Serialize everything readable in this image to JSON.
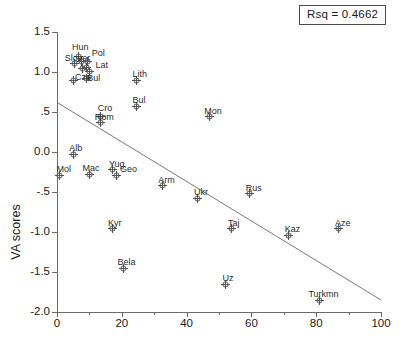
{
  "annotation": {
    "rsq_label": "Rsq = 0.4662"
  },
  "axes": {
    "ylabel": "VA scores",
    "xlabel": "",
    "y_ticks": [
      "1.5",
      "1.0",
      ".5",
      "0.0",
      "-.5",
      "-1.0",
      "-1.5",
      "-2.0"
    ],
    "x_ticks": [
      "0",
      "20",
      "40",
      "60",
      "80",
      "100"
    ]
  },
  "chart_data": {
    "type": "scatter",
    "title": "",
    "xlabel": "",
    "ylabel": "VA scores",
    "xlim": [
      0,
      100
    ],
    "ylim": [
      -2.0,
      1.5
    ],
    "grid": false,
    "legend": null,
    "annotations": [
      {
        "name": "rsq",
        "text": "Rsq = 0.4662",
        "value": 0.4662
      }
    ],
    "trendline": {
      "type": "linear",
      "x": [
        0,
        100
      ],
      "y": [
        0.62,
        -1.85
      ],
      "slope": -0.0247,
      "intercept": 0.62
    },
    "points": [
      {
        "label": "Hun",
        "x": 6.5,
        "y": 1.19
      },
      {
        "label": "Slov",
        "x": 5.5,
        "y": 1.11
      },
      {
        "label": "Slover",
        "x": 7.5,
        "y": 1.13
      },
      {
        "label": "Pol",
        "x": 9.5,
        "y": 1.13
      },
      {
        "label": "Cze",
        "x": 8.0,
        "y": 1.05
      },
      {
        "label": "Est",
        "x": 9.0,
        "y": 1.06
      },
      {
        "label": "Lat",
        "x": 10.0,
        "y": 1.01
      },
      {
        "label": "Cro",
        "x": 5.0,
        "y": 0.9
      },
      {
        "label": "Bul2",
        "x": 9.0,
        "y": 0.92
      },
      {
        "label": "Lith",
        "x": 24.5,
        "y": 0.9
      },
      {
        "label": "Bul",
        "x": 24.5,
        "y": 0.57
      },
      {
        "label": "Cro2",
        "x": 13.5,
        "y": 0.44
      },
      {
        "label": "Rom",
        "x": 13.5,
        "y": 0.37
      },
      {
        "label": "Mon",
        "x": 47.0,
        "y": 0.44
      },
      {
        "label": "Alb",
        "x": 5.0,
        "y": -0.03
      },
      {
        "label": "Mol",
        "x": 0.8,
        "y": -0.29
      },
      {
        "label": "Mac",
        "x": 10.0,
        "y": -0.28
      },
      {
        "label": "Yug",
        "x": 17.0,
        "y": -0.22
      },
      {
        "label": "Geo",
        "x": 18.5,
        "y": -0.29
      },
      {
        "label": "Arm",
        "x": 32.5,
        "y": -0.42
      },
      {
        "label": "Ukr",
        "x": 43.5,
        "y": -0.58
      },
      {
        "label": "Rus",
        "x": 59.5,
        "y": -0.52
      },
      {
        "label": "Kyr",
        "x": 17.0,
        "y": -0.96
      },
      {
        "label": "Taj",
        "x": 54.0,
        "y": -0.96
      },
      {
        "label": "Kaz",
        "x": 71.5,
        "y": -1.04
      },
      {
        "label": "Aze",
        "x": 87.0,
        "y": -0.96
      },
      {
        "label": "Bela",
        "x": 20.5,
        "y": -1.45
      },
      {
        "label": "Uz",
        "x": 52.0,
        "y": -1.65
      },
      {
        "label": "Turkmn",
        "x": 81.0,
        "y": -1.85
      }
    ],
    "point_labels": [
      {
        "text": "Hun",
        "x": 6.5,
        "y": 1.19,
        "dx": -6,
        "dy": -14
      },
      {
        "text": "Slover",
        "x": 5.5,
        "y": 1.13,
        "dx": -10,
        "dy": -8
      },
      {
        "text": "Pol",
        "x": 9.5,
        "y": 1.17,
        "dx": 4,
        "dy": -9
      },
      {
        "text": "Lat",
        "x": 10.0,
        "y": 1.07,
        "dx": 6,
        "dy": -5
      },
      {
        "text": "Cze",
        "x": 8.0,
        "y": 1.0,
        "dx": -8,
        "dy": 1
      },
      {
        "text": "Bul",
        "x": 9.0,
        "y": 0.99,
        "dx": 1,
        "dy": 1
      },
      {
        "text": "Lith",
        "x": 24.5,
        "y": 0.9,
        "dx": -4,
        "dy": -10
      },
      {
        "text": "Bul",
        "x": 24.5,
        "y": 0.57,
        "dx": -4,
        "dy": -10
      },
      {
        "text": "Cro",
        "x": 13.5,
        "y": 0.44,
        "dx": -3,
        "dy": -13
      },
      {
        "text": "Rom",
        "x": 13.5,
        "y": 0.37,
        "dx": -6,
        "dy": -9
      },
      {
        "text": "Mon",
        "x": 47.0,
        "y": 0.44,
        "dx": -5,
        "dy": -10
      },
      {
        "text": "Alb",
        "x": 5.0,
        "y": -0.03,
        "dx": -4,
        "dy": -10
      },
      {
        "text": "Mol",
        "x": 0.8,
        "y": -0.29,
        "dx": -3,
        "dy": -10
      },
      {
        "text": "Mac",
        "x": 10.0,
        "y": -0.28,
        "dx": -7,
        "dy": -10
      },
      {
        "text": "Yug",
        "x": 17.0,
        "y": -0.22,
        "dx": -3,
        "dy": -10
      },
      {
        "text": "Geo",
        "x": 18.5,
        "y": -0.29,
        "dx": 3,
        "dy": -10
      },
      {
        "text": "Arm",
        "x": 32.5,
        "y": -0.42,
        "dx": -4,
        "dy": -10
      },
      {
        "text": "Ukr",
        "x": 43.5,
        "y": -0.58,
        "dx": -4,
        "dy": -10
      },
      {
        "text": "Rus",
        "x": 59.5,
        "y": -0.52,
        "dx": -4,
        "dy": -10
      },
      {
        "text": "Kyr",
        "x": 17.0,
        "y": -0.96,
        "dx": -4,
        "dy": -10
      },
      {
        "text": "Taj",
        "x": 54.0,
        "y": -0.96,
        "dx": -4,
        "dy": -10
      },
      {
        "text": "Kaz",
        "x": 71.5,
        "y": -1.04,
        "dx": -4,
        "dy": -10
      },
      {
        "text": "Aze",
        "x": 87.0,
        "y": -0.96,
        "dx": -4,
        "dy": -10
      },
      {
        "text": "Bela",
        "x": 20.5,
        "y": -1.45,
        "dx": -6,
        "dy": -10
      },
      {
        "text": "Uz",
        "x": 52.0,
        "y": -1.65,
        "dx": -3,
        "dy": -10
      },
      {
        "text": "Turkmn",
        "x": 81.0,
        "y": -1.85,
        "dx": -11,
        "dy": -10
      }
    ]
  },
  "style": {
    "axis_color": "#6b6b6b",
    "marker_color": "#555555",
    "line_color": "#7a7a7a",
    "text_color": "#1a1a1a"
  }
}
